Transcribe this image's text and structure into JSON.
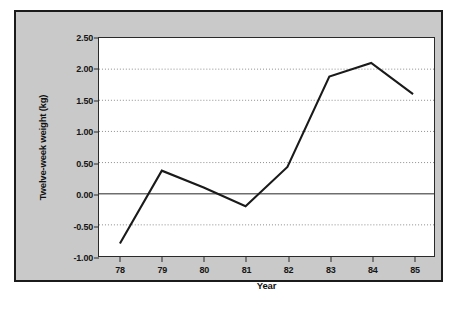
{
  "chart_data": {
    "type": "line",
    "title": "",
    "xlabel": "Year",
    "ylabel": "Twelve-week weight (kg)",
    "categories": [
      "78",
      "79",
      "80",
      "81",
      "82",
      "83",
      "84",
      "85"
    ],
    "x": [
      78,
      79,
      80,
      81,
      82,
      83,
      84,
      85
    ],
    "values": [
      -0.8,
      0.37,
      0.1,
      -0.2,
      0.43,
      1.88,
      2.1,
      1.6
    ],
    "series": [
      {
        "name": "Twelve-week weight",
        "values": [
          -0.8,
          0.37,
          0.1,
          -0.2,
          0.43,
          1.88,
          2.1,
          1.6
        ]
      }
    ],
    "ylim": [
      -1.0,
      2.5
    ],
    "yticks": [
      2.5,
      2.0,
      1.5,
      1.0,
      0.5,
      0.0,
      -0.5,
      -1.0
    ],
    "ytick_labels": [
      "2.50",
      "2.00",
      "1.50",
      "1.00",
      "0.50",
      "0.00",
      "-0.50",
      "-1.00"
    ],
    "xtick_labels": [
      "78",
      "79",
      "80",
      "81",
      "82",
      "83",
      "84",
      "85"
    ],
    "grid": true,
    "grid_style": "dotted",
    "zero_line": 0.0,
    "legend": "none",
    "colors": {
      "line": "#1a1a1a",
      "grid": "#8c8c8c",
      "zero_line": "#6e6e6e",
      "panel_background": "#c9c9c9",
      "plot_background": "#ffffff",
      "axis": "#2a2a2a",
      "text": "#111111"
    }
  }
}
